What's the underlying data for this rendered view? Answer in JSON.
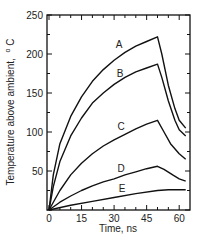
{
  "chart_data": {
    "type": "line",
    "title": "",
    "xlabel": "Time, ns",
    "ylabel": "Temperature above ambient, °C",
    "xlim": [
      0,
      63
    ],
    "ylim": [
      0,
      250
    ],
    "xticks": [
      0,
      15,
      30,
      45,
      60
    ],
    "yticks": [
      50,
      100,
      150,
      200,
      250
    ],
    "grid": false,
    "legend": "inline curve labels",
    "series": [
      {
        "name": "A",
        "x": [
          0,
          2,
          5,
          10,
          15,
          20,
          25,
          30,
          35,
          40,
          45,
          50,
          52,
          55,
          58,
          60,
          63
        ],
        "values": [
          0,
          45,
          85,
          120,
          145,
          165,
          180,
          192,
          202,
          210,
          216,
          222,
          200,
          160,
          130,
          115,
          105
        ]
      },
      {
        "name": "B",
        "x": [
          0,
          2,
          5,
          10,
          15,
          20,
          25,
          30,
          35,
          40,
          45,
          50,
          52,
          55,
          58,
          60,
          63
        ],
        "values": [
          0,
          30,
          62,
          95,
          118,
          137,
          150,
          161,
          170,
          177,
          182,
          187,
          170,
          140,
          115,
          103,
          95
        ]
      },
      {
        "name": "C",
        "x": [
          0,
          5,
          10,
          15,
          20,
          25,
          30,
          35,
          40,
          45,
          50,
          53,
          56,
          60,
          63
        ],
        "values": [
          0,
          25,
          45,
          60,
          72,
          82,
          90,
          97,
          104,
          110,
          115,
          100,
          85,
          72,
          65
        ]
      },
      {
        "name": "D",
        "x": [
          0,
          5,
          10,
          15,
          20,
          25,
          30,
          35,
          40,
          45,
          50,
          53,
          57,
          60,
          63
        ],
        "values": [
          0,
          10,
          18,
          25,
          31,
          36,
          40,
          45,
          49,
          53,
          56,
          52,
          45,
          40,
          37
        ]
      },
      {
        "name": "E",
        "x": [
          0,
          10,
          20,
          30,
          40,
          50,
          55,
          60,
          63
        ],
        "values": [
          0,
          6,
          11,
          16,
          21,
          25,
          26,
          26,
          26
        ]
      }
    ]
  },
  "labels": {
    "y_axis_title": "Temperature above ambient, °C",
    "y_title_main": "Temperature above ambient,",
    "y_title_unit": "C",
    "y_title_degree": "o",
    "x_axis_title": "Time, ns",
    "x_ticks": [
      "0",
      "15",
      "30",
      "45",
      "60"
    ],
    "y_ticks": [
      "50",
      "100",
      "150",
      "200",
      "250"
    ],
    "curves": [
      "A",
      "B",
      "C",
      "D",
      "E"
    ]
  }
}
